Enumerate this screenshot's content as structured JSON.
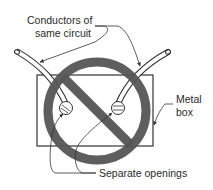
{
  "diagram": {
    "type": "prohibition-illustration",
    "labels": {
      "conductors_line1": "Conductors of",
      "conductors_line2": "same circuit",
      "metal_line1": "Metal",
      "metal_line2": "box",
      "openings": "Separate openings"
    },
    "colors": {
      "prohibition_symbol": "#555555",
      "lines": "#333333",
      "background": "#ffffff"
    }
  }
}
